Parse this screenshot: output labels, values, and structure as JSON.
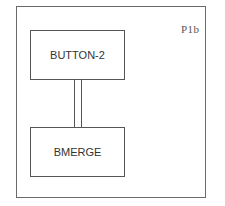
{
  "diagram": {
    "panel_label": "P1b",
    "nodes": [
      {
        "id": "button-2",
        "label": "BUTTON-2"
      },
      {
        "id": "bmerge",
        "label": "BMERGE"
      }
    ],
    "edges": [
      {
        "from": "button-2",
        "to": "bmerge",
        "style": "double-line"
      }
    ]
  }
}
